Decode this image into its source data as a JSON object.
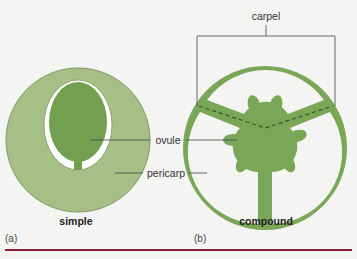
{
  "figure": {
    "panels": [
      {
        "id": "a",
        "letter": "(a)",
        "caption": "simple"
      },
      {
        "id": "b",
        "letter": "(b)",
        "caption": "compound"
      }
    ],
    "labels": {
      "carpel": "carpel",
      "ovule": "ovule",
      "pericarp": "pericarp"
    },
    "colors": {
      "pericarp_light": "#9bb77a",
      "ovule_dark": "#6f9a4c",
      "compound_green": "#7aa657",
      "divider": "#8a1f3c",
      "background": "#f4f4f2"
    }
  }
}
